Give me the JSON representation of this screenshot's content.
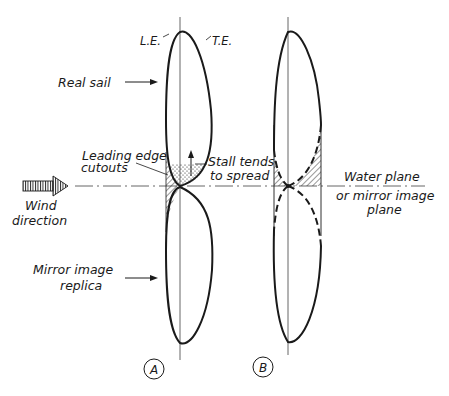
{
  "diagram": {
    "labels": {
      "leading_edge": "L.E.",
      "trailing_edge": "T.E.",
      "real_sail": "Real sail",
      "leading_edge_cutouts_line1": "Leading edge",
      "leading_edge_cutouts_line2": "cutouts",
      "stall_line1": "Stall tends",
      "stall_line2": "to spread",
      "wind_line1": "Wind",
      "wind_line2": "direction",
      "water_plane_line1": "Water plane",
      "water_plane_line2": "or mirror image",
      "water_plane_line3": "plane",
      "mirror_line1": "Mirror image",
      "mirror_line2": "replica",
      "panel_a": "A",
      "panel_b": "B"
    },
    "colors": {
      "ink": "#1a1a1a",
      "axis": "#555555",
      "background": "#ffffff"
    }
  }
}
